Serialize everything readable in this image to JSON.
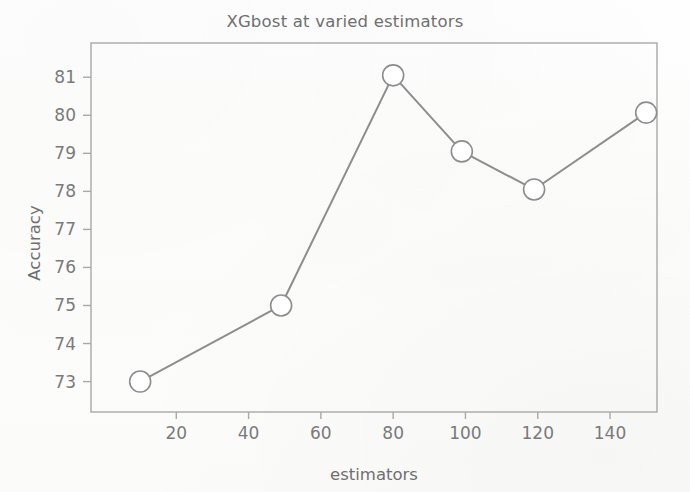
{
  "chart_data": {
    "type": "line",
    "title": "XGbost at varied estimators",
    "xlabel": "estimators",
    "ylabel": "Accuracy",
    "x": [
      10,
      49,
      80,
      99,
      119,
      150
    ],
    "values": [
      73.0,
      75.0,
      81.05,
      79.05,
      78.05,
      80.07
    ],
    "series": [
      {
        "name": "Accuracy",
        "x": [
          10,
          49,
          80,
          99,
          119,
          150
        ],
        "values": [
          73.0,
          75.0,
          81.05,
          79.05,
          78.05,
          80.07
        ]
      }
    ],
    "xticks": [
      20,
      40,
      60,
      80,
      100,
      120,
      140
    ],
    "xtick_labels": [
      "20",
      "40",
      "60",
      "80",
      "100",
      "120",
      "140"
    ],
    "yticks": [
      73,
      74,
      75,
      76,
      77,
      78,
      79,
      80,
      81
    ],
    "ytick_labels": [
      "73",
      "74",
      "75",
      "76",
      "77",
      "78",
      "79",
      "80",
      "81"
    ],
    "xlim": [
      -3.6,
      153.0
    ],
    "ylim": [
      72.2,
      81.9
    ],
    "grid": false,
    "legend": false,
    "legend_position": "none",
    "marker": "circle-open",
    "line_color": "#8d8d8e",
    "marker_edge_color": "#8d8d8e",
    "marker_face_color": "#ffffff",
    "axis_color": "#a9a9aa",
    "text_color": "#747475"
  }
}
